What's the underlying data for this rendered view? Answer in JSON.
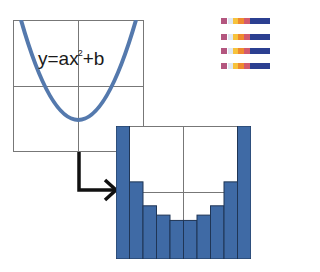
{
  "equation": {
    "prefix": "y=ax",
    "exponent": "2",
    "suffix": "+b"
  },
  "colors": {
    "curve": "#5479ad",
    "bar": "#3f6aa5",
    "bar_edge": "#1f3555",
    "grid": "#777777",
    "arrow": "#111111"
  },
  "chart_data": {
    "type": "bar",
    "title": "",
    "categories": [
      "1",
      "2",
      "3",
      "4",
      "5",
      "6",
      "7",
      "8",
      "9",
      "10"
    ],
    "values": [
      100,
      58,
      40,
      33,
      29,
      29,
      33,
      40,
      58,
      100
    ],
    "xlabel": "",
    "ylabel": "",
    "ylim": [
      0,
      100
    ],
    "grid": true
  },
  "legend_strip": {
    "rows": 4,
    "swatches": [
      "#b3567f",
      "#dfe8f2",
      "#f6c23c",
      "#ef8a2e",
      "#d25a6e",
      "#2b3f91"
    ]
  }
}
